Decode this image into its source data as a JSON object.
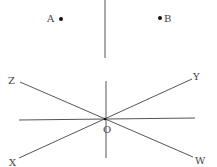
{
  "diagram": {
    "points": [
      {
        "label": "A",
        "x": 60,
        "y": 19
      },
      {
        "label": "B",
        "x": 160,
        "y": 18
      }
    ],
    "top_line": {
      "x": 105,
      "y1": 0,
      "y2": 58
    },
    "center": {
      "label": "O",
      "x": 105,
      "y": 119
    },
    "rays": [
      {
        "label": "Z",
        "x": 20,
        "y": 82
      },
      {
        "label": "Y",
        "x": 192,
        "y": 79
      },
      {
        "label": "X",
        "x": 19,
        "y": 158
      },
      {
        "label": "W",
        "x": 193,
        "y": 157
      }
    ],
    "line_color": "#444444"
  }
}
